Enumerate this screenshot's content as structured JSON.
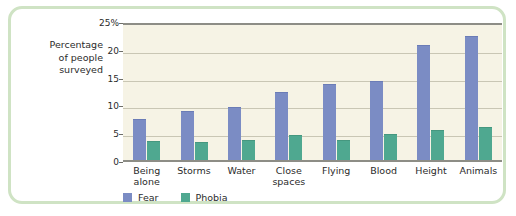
{
  "chart_data": {
    "type": "bar",
    "title": "",
    "xlabel": "",
    "ylabel": "Percentage\nof people\nsurveyed",
    "ylim": [
      0,
      25
    ],
    "yticks": [
      0,
      5,
      10,
      15,
      20,
      25
    ],
    "ytick_labels": [
      "0",
      "5",
      "10",
      "15",
      "20",
      "25%"
    ],
    "grid": true,
    "legend_position": "bottom-left",
    "categories": [
      "Being\nalone",
      "Storms",
      "Water",
      "Close\nspaces",
      "Flying",
      "Blood",
      "Height",
      "Animals"
    ],
    "series": [
      {
        "name": "Fear",
        "color": "#7b8cc4",
        "values": [
          7.2,
          8.7,
          9.4,
          12.0,
          13.5,
          14.0,
          20.5,
          22.2
        ]
      },
      {
        "name": "Phobia",
        "color": "#4fa890",
        "values": [
          3.2,
          3.0,
          3.5,
          4.4,
          3.5,
          4.5,
          5.3,
          5.7
        ]
      }
    ]
  },
  "colors": {
    "frame_border": "#cfe3c4",
    "plot_background": "#f6f3e5",
    "axis_line": "#8d8d86",
    "gridline": "#c9c6b4",
    "text": "#2b2b2b"
  }
}
